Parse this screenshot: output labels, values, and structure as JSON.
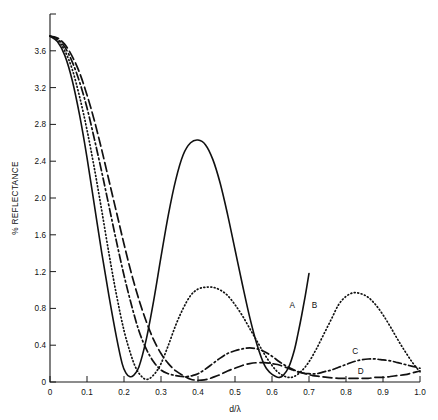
{
  "chart_data": {
    "type": "line",
    "title": "",
    "subtitle": "",
    "xlabel": "d/λ",
    "ylabel": "% REFLECTANCE",
    "xlim": [
      0,
      1.0
    ],
    "ylim": [
      0,
      4.0
    ],
    "grid": false,
    "legend_position": "inline-curve-labels",
    "xticks": [
      0,
      0.1,
      0.2,
      0.3,
      0.4,
      0.5,
      0.6,
      0.7,
      0.8,
      0.9,
      1.0
    ],
    "xtick_labels": [
      "0",
      "0.1",
      "0.2",
      "0.3",
      "0.4",
      "0.5",
      "0.6",
      "0.7",
      "0.8",
      "0.9",
      "1.0"
    ],
    "yticks": [
      0,
      0.4,
      0.8,
      1.2,
      1.6,
      2.0,
      2.4,
      2.8,
      3.2,
      3.6,
      4.0
    ],
    "ytick_labels": [
      "0",
      "0.4",
      "0.8",
      "1.2",
      "1.6",
      "2.0",
      "2.4",
      "2.8",
      "3.2",
      "3.6",
      ""
    ],
    "annotations": [
      {
        "text": "A",
        "x": 0.655,
        "y": 0.8
      },
      {
        "text": "B",
        "x": 0.715,
        "y": 0.8
      },
      {
        "text": "C",
        "x": 0.825,
        "y": 0.3
      },
      {
        "text": "D",
        "x": 0.84,
        "y": 0.09
      }
    ],
    "series": [
      {
        "name": "A",
        "label": "A",
        "style": "solid",
        "dasharray": "none",
        "color": "#111111",
        "width": 1.6,
        "x": [
          0.0,
          0.02,
          0.04,
          0.06,
          0.08,
          0.1,
          0.12,
          0.14,
          0.16,
          0.18,
          0.195,
          0.205,
          0.215,
          0.225,
          0.24,
          0.26,
          0.28,
          0.3,
          0.32,
          0.34,
          0.36,
          0.38,
          0.4,
          0.42,
          0.44,
          0.46,
          0.48,
          0.5,
          0.52,
          0.54,
          0.56,
          0.58,
          0.595,
          0.61,
          0.62,
          0.63,
          0.645,
          0.66,
          0.67,
          0.68,
          0.69,
          0.7
        ],
        "y": [
          3.76,
          3.7,
          3.55,
          3.28,
          2.9,
          2.44,
          1.92,
          1.4,
          0.92,
          0.48,
          0.2,
          0.1,
          0.06,
          0.07,
          0.16,
          0.46,
          0.88,
          1.36,
          1.82,
          2.2,
          2.47,
          2.6,
          2.63,
          2.58,
          2.42,
          2.16,
          1.82,
          1.44,
          1.06,
          0.7,
          0.4,
          0.18,
          0.1,
          0.06,
          0.05,
          0.07,
          0.16,
          0.34,
          0.52,
          0.72,
          0.94,
          1.18
        ]
      },
      {
        "name": "B",
        "label": "B",
        "style": "dotted",
        "dasharray": "0.9 2.6",
        "color": "#111111",
        "width": 1.7,
        "x": [
          0.0,
          0.02,
          0.04,
          0.06,
          0.08,
          0.1,
          0.12,
          0.14,
          0.16,
          0.18,
          0.2,
          0.22,
          0.235,
          0.25,
          0.26,
          0.27,
          0.285,
          0.3,
          0.32,
          0.34,
          0.36,
          0.38,
          0.4,
          0.42,
          0.44,
          0.46,
          0.48,
          0.5,
          0.52,
          0.54,
          0.56,
          0.58,
          0.6,
          0.615,
          0.63,
          0.645,
          0.66,
          0.68,
          0.7,
          0.72,
          0.74,
          0.76,
          0.78,
          0.8,
          0.82,
          0.84,
          0.86,
          0.88,
          0.9,
          0.92,
          0.94,
          0.96,
          0.98,
          1.0
        ],
        "y": [
          3.76,
          3.72,
          3.6,
          3.4,
          3.1,
          2.74,
          2.32,
          1.86,
          1.38,
          0.94,
          0.56,
          0.28,
          0.13,
          0.05,
          0.03,
          0.04,
          0.1,
          0.2,
          0.4,
          0.62,
          0.8,
          0.94,
          1.01,
          1.03,
          1.03,
          1.0,
          0.94,
          0.84,
          0.72,
          0.58,
          0.44,
          0.3,
          0.18,
          0.11,
          0.07,
          0.05,
          0.06,
          0.12,
          0.22,
          0.36,
          0.52,
          0.68,
          0.84,
          0.93,
          0.97,
          0.96,
          0.92,
          0.84,
          0.73,
          0.6,
          0.46,
          0.33,
          0.21,
          0.11
        ]
      },
      {
        "name": "C",
        "label": "C",
        "style": "dash-dot",
        "dasharray": "8 3 1.6 3",
        "color": "#111111",
        "width": 1.7,
        "x": [
          0.0,
          0.02,
          0.04,
          0.06,
          0.08,
          0.1,
          0.12,
          0.14,
          0.16,
          0.18,
          0.2,
          0.22,
          0.24,
          0.26,
          0.28,
          0.3,
          0.32,
          0.34,
          0.355,
          0.37,
          0.385,
          0.4,
          0.42,
          0.44,
          0.46,
          0.48,
          0.5,
          0.52,
          0.54,
          0.56,
          0.58,
          0.6,
          0.62,
          0.64,
          0.66,
          0.68,
          0.7,
          0.72,
          0.74,
          0.76,
          0.78,
          0.8,
          0.82,
          0.84,
          0.86,
          0.88,
          0.9,
          0.92,
          0.94,
          0.96,
          0.98,
          1.0
        ],
        "y": [
          3.76,
          3.73,
          3.64,
          3.48,
          3.26,
          2.98,
          2.64,
          2.28,
          1.9,
          1.52,
          1.16,
          0.84,
          0.56,
          0.36,
          0.22,
          0.13,
          0.09,
          0.07,
          0.06,
          0.06,
          0.07,
          0.09,
          0.14,
          0.2,
          0.26,
          0.31,
          0.34,
          0.36,
          0.37,
          0.36,
          0.33,
          0.28,
          0.22,
          0.17,
          0.13,
          0.1,
          0.09,
          0.09,
          0.11,
          0.13,
          0.16,
          0.19,
          0.22,
          0.24,
          0.25,
          0.25,
          0.24,
          0.23,
          0.21,
          0.19,
          0.17,
          0.15
        ]
      },
      {
        "name": "D",
        "label": "D",
        "style": "dashed",
        "dasharray": "9 4",
        "color": "#111111",
        "width": 1.7,
        "x": [
          0.0,
          0.02,
          0.04,
          0.06,
          0.08,
          0.1,
          0.12,
          0.14,
          0.16,
          0.18,
          0.2,
          0.22,
          0.24,
          0.26,
          0.28,
          0.3,
          0.32,
          0.34,
          0.36,
          0.38,
          0.395,
          0.41,
          0.425,
          0.44,
          0.46,
          0.48,
          0.5,
          0.52,
          0.54,
          0.56,
          0.58,
          0.6,
          0.615,
          0.63,
          0.65,
          0.67,
          0.69,
          0.71,
          0.73,
          0.75,
          0.78,
          0.81,
          0.84,
          0.86,
          0.88,
          0.9,
          0.92,
          0.94,
          0.96,
          0.98,
          1.0
        ],
        "y": [
          3.76,
          3.74,
          3.67,
          3.54,
          3.36,
          3.12,
          2.84,
          2.52,
          2.18,
          1.84,
          1.5,
          1.18,
          0.9,
          0.66,
          0.46,
          0.31,
          0.2,
          0.12,
          0.07,
          0.03,
          0.02,
          0.02,
          0.03,
          0.05,
          0.08,
          0.12,
          0.15,
          0.18,
          0.2,
          0.21,
          0.21,
          0.2,
          0.19,
          0.17,
          0.14,
          0.11,
          0.09,
          0.07,
          0.06,
          0.05,
          0.04,
          0.04,
          0.04,
          0.04,
          0.05,
          0.05,
          0.06,
          0.07,
          0.08,
          0.1,
          0.12
        ]
      }
    ]
  }
}
